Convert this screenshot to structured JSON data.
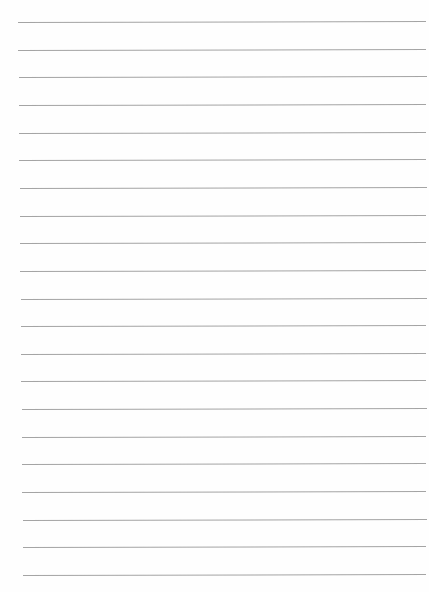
{
  "page": {
    "type": "lined-paper",
    "background": "#fefefe",
    "line_color": "#9a9a9a",
    "line_count": 21,
    "first_line_y": 22,
    "last_line_y": 575,
    "line_spacing": 27.65,
    "left_start_top": 18,
    "left_start_bottom": 23,
    "right_end": 426,
    "tilt_deg": -0.15
  }
}
